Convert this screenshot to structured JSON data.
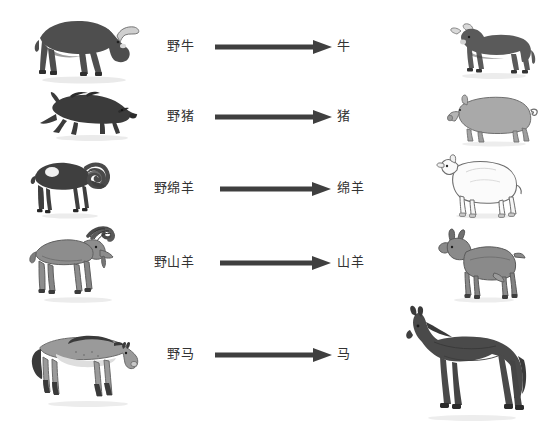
{
  "figure": {
    "type": "diagram",
    "background_color": "#ffffff",
    "text_color": "#333333",
    "arrow_color": "#3f3f3f",
    "rows": [
      {
        "id": "cattle",
        "wild_label": "野牛",
        "domestic_label": "牛",
        "arrow": "right-arrow",
        "wild_icon": "aurochs-silhouette",
        "domestic_icon": "cow-silhouette",
        "wild_color": "#4e4e4e",
        "domestic_color": "#5a5a5a"
      },
      {
        "id": "pig",
        "wild_label": "野猪",
        "domestic_label": "猪",
        "arrow": "right-arrow",
        "wild_icon": "wild-boar-silhouette",
        "domestic_icon": "pig-silhouette",
        "wild_color": "#3b3b3b",
        "domestic_color": "#a9a9a9"
      },
      {
        "id": "sheep",
        "wild_label": "野绵羊",
        "domestic_label": "绵羊",
        "arrow": "right-arrow",
        "wild_icon": "mouflon-silhouette",
        "domestic_icon": "sheep-silhouette",
        "wild_color": "#3f3f3f",
        "domestic_color": "#fbfbfb"
      },
      {
        "id": "goat",
        "wild_label": "野山羊",
        "domestic_label": "山羊",
        "arrow": "right-arrow",
        "wild_icon": "wild-goat-silhouette",
        "domestic_icon": "goat-silhouette",
        "wild_color": "#8d8d8d",
        "domestic_color": "#8a8a8a"
      },
      {
        "id": "horse",
        "wild_label": "野马",
        "domestic_label": "马",
        "arrow": "right-arrow",
        "wild_icon": "przewalski-horse-silhouette",
        "domestic_icon": "horse-silhouette",
        "wild_color": "#9a9a9a",
        "domestic_color": "#4a4a4a"
      }
    ]
  }
}
